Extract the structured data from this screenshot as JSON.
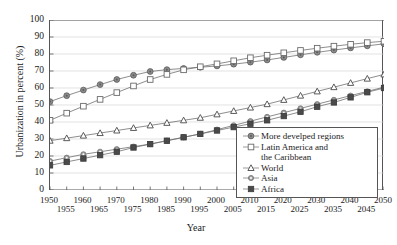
{
  "chart_data": {
    "type": "line",
    "title": "",
    "xlabel": "Year",
    "ylabel": "Urbanization in percent (%)",
    "xlim": [
      1950,
      2050
    ],
    "ylim": [
      0,
      100
    ],
    "grid": "horizontal",
    "legend_position": "inside-bottom-right",
    "x": [
      1950,
      1955,
      1960,
      1965,
      1970,
      1975,
      1980,
      1985,
      1990,
      1995,
      2000,
      2005,
      2010,
      2015,
      2020,
      2025,
      2030,
      2035,
      2040,
      2045,
      2050
    ],
    "xticks_row0": [
      "1950",
      "1960",
      "1970",
      "1980",
      "1990",
      "2000",
      "2010",
      "2020",
      "2030",
      "2040",
      "2050"
    ],
    "xticks_row1": [
      "1955",
      "1965",
      "1975",
      "1985",
      "1995",
      "2005",
      "2015",
      "2025",
      "2035",
      "2045"
    ],
    "yticks": [
      "0",
      "10",
      "20",
      "30",
      "40",
      "50",
      "60",
      "70",
      "80",
      "90",
      "100"
    ],
    "series": [
      {
        "name": "More develped regions",
        "marker": "filled-circle",
        "color": "#8c8c8c",
        "values": [
          52.0,
          55.5,
          58.8,
          62.0,
          65.0,
          67.5,
          69.7,
          70.8,
          71.5,
          72.2,
          73.0,
          74.0,
          75.2,
          76.5,
          78.0,
          79.5,
          81.0,
          82.3,
          83.6,
          84.8,
          86.0
        ]
      },
      {
        "name": "Latin America and the Caribbean",
        "marker": "open-square",
        "color": "#9a9a9a",
        "values": [
          41.0,
          45.2,
          49.3,
          53.3,
          57.3,
          61.2,
          65.0,
          68.0,
          70.7,
          72.5,
          74.2,
          76.0,
          77.8,
          79.3,
          80.7,
          82.1,
          83.4,
          84.6,
          85.7,
          86.7,
          87.5
        ]
      },
      {
        "name": "World",
        "marker": "open-triangle",
        "color": "#555555",
        "values": [
          29.0,
          30.5,
          32.0,
          33.5,
          35.0,
          36.5,
          38.0,
          39.5,
          41.0,
          42.5,
          44.5,
          46.5,
          48.5,
          50.5,
          53.0,
          55.5,
          58.0,
          60.5,
          63.0,
          65.5,
          68.0
        ]
      },
      {
        "name": "Asia",
        "marker": "small-open-circle",
        "color": "#8c8c8c",
        "values": [
          17.0,
          19.0,
          21.0,
          22.5,
          24.0,
          25.5,
          27.0,
          29.0,
          31.0,
          33.0,
          35.5,
          38.0,
          40.5,
          43.0,
          45.5,
          48.0,
          50.5,
          53.0,
          55.5,
          58.0,
          60.5
        ]
      },
      {
        "name": "Africa",
        "marker": "filled-square",
        "color": "#4a4a4a",
        "values": [
          14.5,
          16.5,
          18.5,
          20.5,
          22.5,
          25.0,
          27.0,
          29.0,
          31.0,
          33.0,
          35.0,
          37.0,
          39.0,
          41.0,
          43.5,
          46.0,
          49.0,
          51.5,
          54.5,
          57.5,
          60.0
        ]
      }
    ],
    "legend_entries": [
      {
        "label": "More develped regions",
        "continuation": ""
      },
      {
        "label": "Latin America and",
        "continuation": "the Caribbean"
      },
      {
        "label": "World",
        "continuation": ""
      },
      {
        "label": "Asia",
        "continuation": ""
      },
      {
        "label": "Africa",
        "continuation": ""
      }
    ]
  }
}
